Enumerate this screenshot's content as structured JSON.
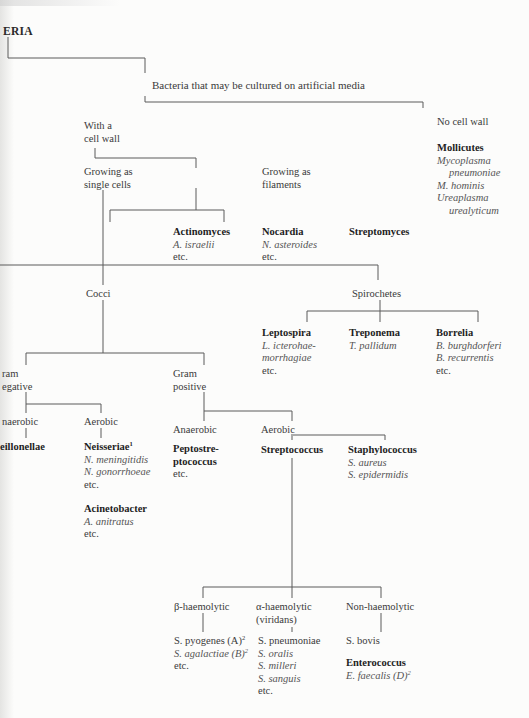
{
  "page": {
    "title_fragment": "ERIA",
    "title_prefix_mark": "'"
  },
  "tree": {
    "cultured": "Bacteria that may be cultured on artificial media",
    "with_wall": [
      "With a",
      "cell wall"
    ],
    "no_wall": "No cell wall",
    "mollicutes": {
      "name": "Mollicutes",
      "species": [
        "Mycoplasma",
        "pneumoniae",
        "M. hominis",
        "Ureaplasma",
        "urealyticum"
      ]
    },
    "single_cells": [
      "Growing as",
      "single cells"
    ],
    "filaments": [
      "Growing as",
      "filaments"
    ],
    "actinomyces": {
      "name": "Actinomyces",
      "species": "A. israelii",
      "etc": "etc."
    },
    "nocardia": {
      "name": "Nocardia",
      "species": "N. asteroides",
      "etc": "etc."
    },
    "streptomyces": {
      "name": "Streptomyces"
    },
    "cocci": "Cocci",
    "spirochetes": "Spirochetes",
    "leptospira": {
      "name": "Leptospira",
      "species": [
        "L. icterohae-",
        "morrhagiae"
      ],
      "etc": "etc."
    },
    "treponema": {
      "name": "Treponema",
      "species": "T. pallidum"
    },
    "borrelia": {
      "name": "Borrelia",
      "species": [
        "B. burghdorferi",
        "B. recurrentis"
      ],
      "etc": "etc."
    },
    "gram_negative": [
      "ram",
      "egative"
    ],
    "gram_positive": [
      "Gram",
      "positive"
    ],
    "gn_anaerobic": "naerobic",
    "veillonellae": "eillonellae",
    "gn_aerobic": "Aerobic",
    "neisseriae": {
      "name": "Neisseriae",
      "sup": "1",
      "species": [
        "N. meningitidis",
        "N. gonorrhoeae"
      ],
      "etc": "etc."
    },
    "acinetobacter": {
      "name": "Acinetobacter",
      "species": "A. anitratus",
      "etc": "etc."
    },
    "gp_anaerobic": "Anaerobic",
    "peptostreptococcus": {
      "name": [
        "Peptostre-",
        "ptococcus"
      ],
      "etc": "etc."
    },
    "gp_aerobic": "Aerobic",
    "streptococcus": "Streptococcus",
    "staphylococcus": {
      "name": "Staphylococcus",
      "species": [
        "S. aureus",
        "S. epidermidis"
      ]
    },
    "beta": "β-haemolytic",
    "alpha": [
      "α-haemolytic",
      "(viridans)"
    ],
    "non_haem": "Non-haemolytic",
    "beta_species": {
      "s1": "S. pyogenes (A)",
      "s1_sup": "2",
      "s2": "S. agalactiae (B)",
      "s2_sup": "2",
      "etc": "etc."
    },
    "alpha_species": {
      "s1": "S. pneumoniae",
      "s2": "S. oralis",
      "s3": "S. milleri",
      "s4": "S. sanguis",
      "etc": "etc."
    },
    "non_species": {
      "s1": "S. bovis"
    },
    "enterococcus": {
      "name": "Enterococcus",
      "species": "E. faecalis (D)",
      "sup": "2"
    }
  }
}
